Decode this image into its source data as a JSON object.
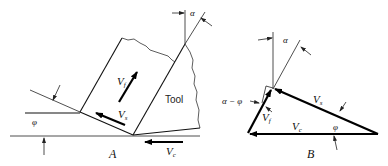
{
  "figure_a": {
    "caption": "A",
    "tool_label": "Tool",
    "vf_label": "V",
    "vf_sub": "f",
    "vs_label": "V",
    "vs_sub": "s",
    "vc_label": "V",
    "vc_sub": "c",
    "phi_label": "φ",
    "alpha_label": "α"
  },
  "figure_b": {
    "caption": "B",
    "vf_label": "V",
    "vf_sub": "f",
    "vs_label": "V",
    "vs_sub": "s",
    "vc_label": "V",
    "vc_sub": "c",
    "phi_label": "φ",
    "alpha_label": "α",
    "alpha_minus_phi_label": "α − φ"
  }
}
